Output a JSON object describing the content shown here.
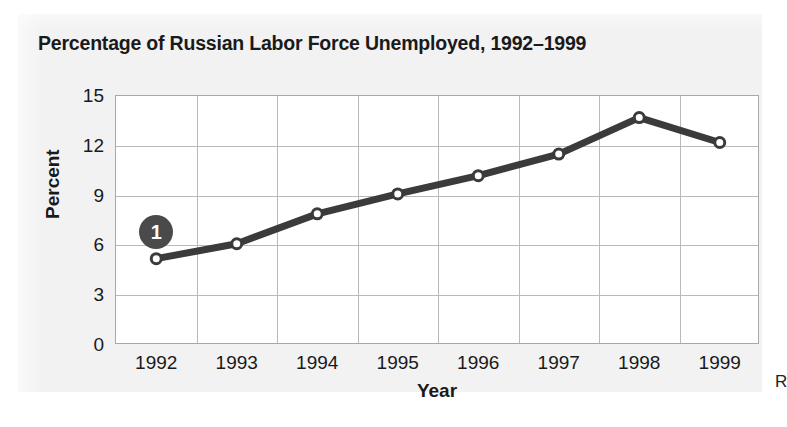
{
  "figure": {
    "title": "Percentage of Russian Labor Force Unemployed, 1992–1999",
    "margin_letter": "R",
    "panel_background": "#f2f2f2",
    "plot_background": "#ffffff",
    "line_color": "#3b3b3b",
    "grid_color": "#b9b9b9",
    "frame_color": "#a8a8a8",
    "text_color": "#1a1a1a",
    "badge_color": "#4a4a4a"
  },
  "annotations": [
    {
      "name": "callout-1",
      "label": "1",
      "x_year": "1992",
      "y_value": 6.8
    }
  ],
  "chart_data": {
    "type": "line",
    "title": "Percentage of Russian Labor Force Unemployed, 1992–1999",
    "xlabel": "Year",
    "ylabel": "Percent",
    "categories": [
      "1992",
      "1993",
      "1994",
      "1995",
      "1996",
      "1997",
      "1998",
      "1999"
    ],
    "values": [
      5.2,
      6.1,
      7.9,
      9.1,
      10.2,
      11.5,
      13.7,
      12.2
    ],
    "series": [
      {
        "name": "Percent unemployed",
        "values": [
          5.2,
          6.1,
          7.9,
          9.1,
          10.2,
          11.5,
          13.7,
          12.2
        ]
      }
    ],
    "ylim": [
      0,
      15
    ],
    "yticks": [
      0,
      3,
      6,
      9,
      12,
      15
    ],
    "ytick_labels": [
      "0",
      "3",
      "6",
      "9",
      "12",
      "15"
    ],
    "xticks": [
      "1992",
      "1993",
      "1994",
      "1995",
      "1996",
      "1997",
      "1998",
      "1999"
    ],
    "grid": true,
    "legend": "none",
    "marker": "open-circle"
  }
}
